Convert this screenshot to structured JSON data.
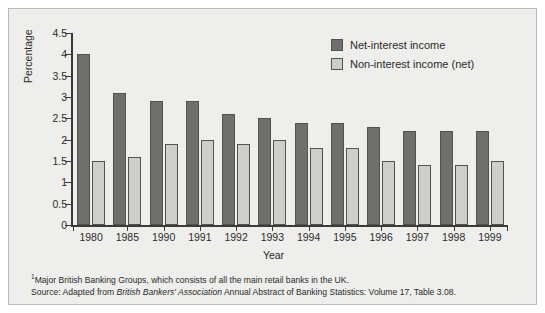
{
  "chart_data": {
    "type": "bar",
    "title": "",
    "xlabel": "Year",
    "ylabel": "Percentage",
    "ylim": [
      0,
      4.5
    ],
    "yticks": [
      "0",
      "0.5",
      "1",
      "1.5",
      "2",
      "2.5",
      "3",
      "3.5",
      "4",
      "4.5"
    ],
    "grid": false,
    "legend_position": "top-right",
    "categories": [
      "1980",
      "1985",
      "1990",
      "1991",
      "1992",
      "1993",
      "1994",
      "1995",
      "1996",
      "1997",
      "1998",
      "1999"
    ],
    "series": [
      {
        "name": "Net-interest income",
        "color": "#6f6f6d",
        "values": [
          4.0,
          3.1,
          2.9,
          2.9,
          2.6,
          2.5,
          2.4,
          2.4,
          2.3,
          2.2,
          2.2,
          2.2
        ]
      },
      {
        "name": "Non-interest income (net)",
        "color": "#cfcfca",
        "values": [
          1.5,
          1.6,
          1.9,
          2.0,
          1.9,
          2.0,
          1.8,
          1.8,
          1.5,
          1.4,
          1.4,
          1.5
        ]
      }
    ]
  },
  "axes": {
    "y_title": "Percentage",
    "x_title": "Year"
  },
  "legend": {
    "items": [
      {
        "label": "Net-interest income"
      },
      {
        "label": "Non-interest income (net)"
      }
    ]
  },
  "footnotes": {
    "line1_marker": "1",
    "line1_text": "Major British Banking Groups, which consists of all the main retail banks in the UK.",
    "line2_prefix": "Source: Adapted from ",
    "line2_italic": "British Bankers' Association",
    "line2_suffix": " Annual Abstract of Banking Statistics: Volume 17, Table 3.08."
  }
}
